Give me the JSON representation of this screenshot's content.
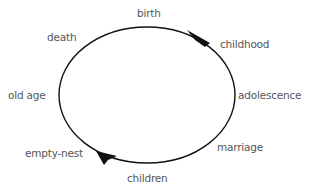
{
  "diagram": {
    "type": "cycle",
    "colors": {
      "stroke": "#111111",
      "text": "#555555",
      "background": "#ffffff"
    },
    "stages": [
      {
        "id": "birth",
        "label": "birth"
      },
      {
        "id": "childhood",
        "label": "childhood"
      },
      {
        "id": "adolescence",
        "label": "adolescence"
      },
      {
        "id": "marriage",
        "label": "marriage"
      },
      {
        "id": "children",
        "label": "children"
      },
      {
        "id": "empty-nest",
        "label": "empty-nest"
      },
      {
        "id": "old-age",
        "label": "old age"
      },
      {
        "id": "death",
        "label": "death"
      }
    ],
    "direction": "clockwise"
  }
}
